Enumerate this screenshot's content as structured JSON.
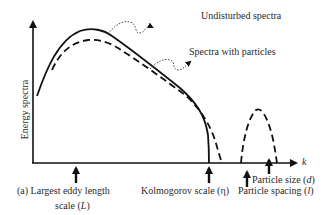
{
  "figure": {
    "panel_label": "(a)",
    "y_axis_label": "Energy spectra",
    "x_axis_label": "k",
    "annotations": {
      "undisturbed": "Undisturbed spectra",
      "with_particles": "Spectra with particles"
    },
    "markers": [
      {
        "id": "largest-eddy",
        "line1": "Largest eddy length",
        "line2_prefix": "scale (",
        "symbol": "L",
        "line2_suffix": ")"
      },
      {
        "id": "kolmogorov",
        "text": "Kolmogorov scale (η)"
      },
      {
        "id": "particle-spacing",
        "prefix": "Particle spacing (",
        "symbol": "l",
        "suffix": ")"
      },
      {
        "id": "particle-size",
        "prefix": "Particle size (",
        "symbol": "d",
        "suffix": ")"
      }
    ],
    "colors": {
      "line": "#111111",
      "text": "#2a2a2a"
    }
  }
}
